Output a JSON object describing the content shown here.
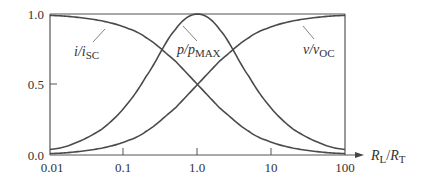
{
  "chart_data": {
    "type": "line",
    "title": "",
    "xlabel": "R_L/R_T",
    "ylabel": "",
    "xscale": "log",
    "xlim": [
      0.01,
      100
    ],
    "ylim": [
      0.0,
      1.0
    ],
    "x_ticks": [
      "0.01",
      "0.1",
      "1.0",
      "10",
      "100"
    ],
    "y_ticks": [
      "0.0",
      "0.5",
      "1.0"
    ],
    "grid": false,
    "legend": "none (inline curve labels)",
    "x": [
      0.01,
      0.02,
      0.05,
      0.1,
      0.2,
      0.5,
      1.0,
      2.0,
      5.0,
      10,
      20,
      50,
      100
    ],
    "series": [
      {
        "name": "i/i_SC",
        "label": "i/iSC",
        "values": [
          0.99,
          0.98,
          0.952,
          0.909,
          0.833,
          0.667,
          0.5,
          0.333,
          0.167,
          0.091,
          0.048,
          0.02,
          0.01
        ]
      },
      {
        "name": "p/p_MAX",
        "label": "p/pMAX",
        "values": [
          0.039,
          0.077,
          0.181,
          0.331,
          0.556,
          0.889,
          1.0,
          0.889,
          0.556,
          0.331,
          0.181,
          0.077,
          0.039
        ]
      },
      {
        "name": "v/v_OC",
        "label": "v/vOC",
        "values": [
          0.01,
          0.02,
          0.048,
          0.091,
          0.167,
          0.333,
          0.5,
          0.667,
          0.833,
          0.909,
          0.952,
          0.98,
          0.99
        ]
      }
    ]
  },
  "labels": {
    "y_top": "1.0",
    "y_mid": "0.5",
    "y_bottom": "0.0",
    "x0": "0.01",
    "x1": "0.1",
    "x2": "1.0",
    "x3": "10",
    "x4": "100",
    "i_main": "i/i",
    "i_sub": "SC",
    "p_main": "p/p",
    "p_sub": "MAX",
    "v_main": "v/v",
    "v_sub": "OC",
    "xaxis_R1": "R",
    "xaxis_L": "L",
    "xaxis_slash": "/",
    "xaxis_R2": "R",
    "xaxis_T": "T"
  },
  "colors": {
    "curve": "#4a4a4a",
    "axis": "#555555"
  }
}
